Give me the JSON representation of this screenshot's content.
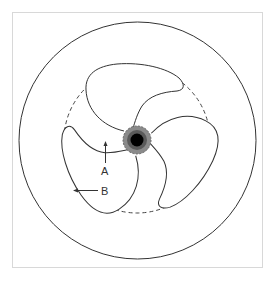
{
  "figure": {
    "type": "impeller-diagram",
    "labels": [
      {
        "id": "A",
        "text": "A",
        "arrow_direction": "up"
      },
      {
        "id": "B",
        "text": "B",
        "arrow_direction": "left"
      }
    ],
    "components": {
      "casing": "outer-circle",
      "impeller_boundary": "dashed-circle",
      "blades": 3,
      "hub": "shaded-hub-with-black-shaft"
    },
    "colors": {
      "line": "#333333",
      "hub_outer": "#8a8a8a",
      "hub_ring": "#5a5a5a",
      "shaft": "#000000",
      "frame": "#d8d8d8"
    }
  }
}
